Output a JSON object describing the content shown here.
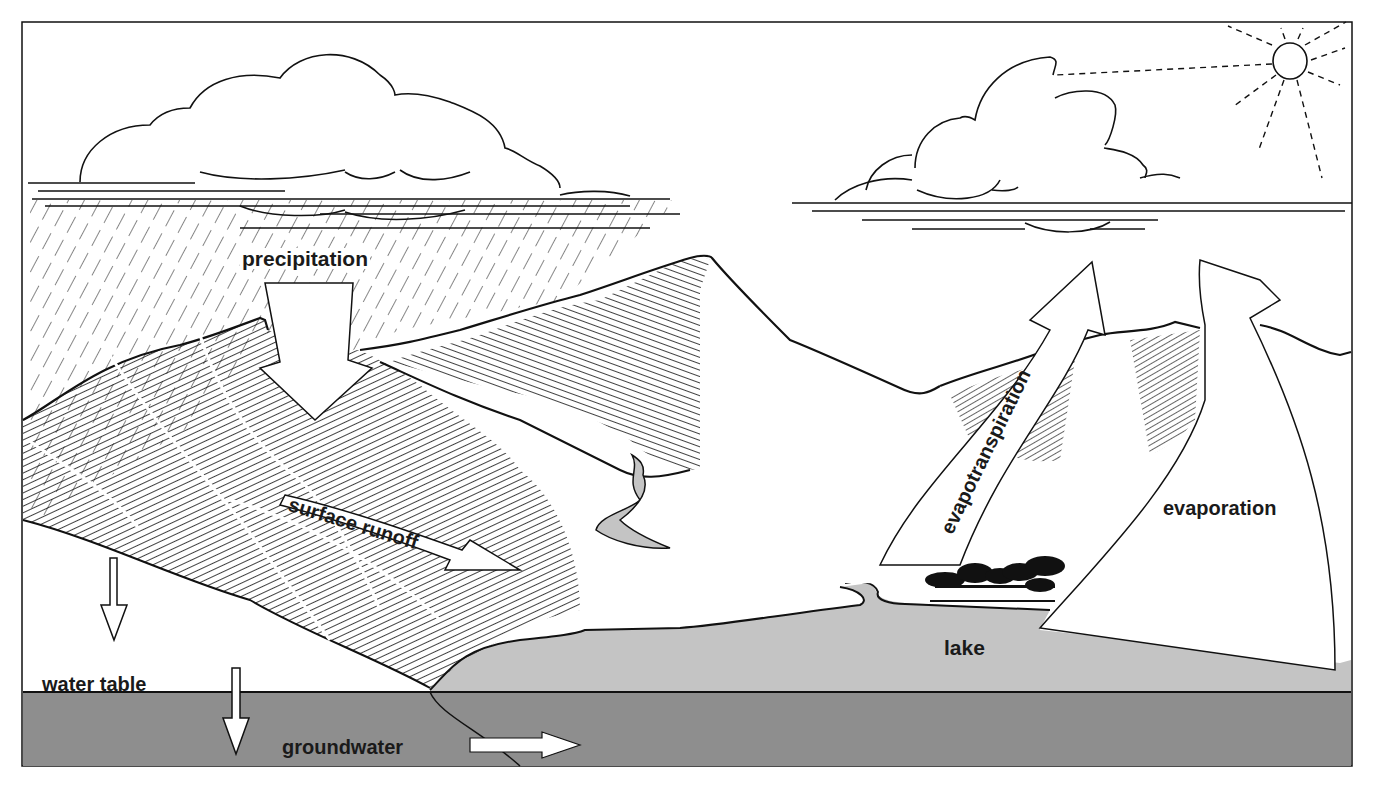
{
  "diagram": {
    "labels": {
      "precipitation": "precipitation",
      "surface_runoff": "surface runoff",
      "evapotranspiration": "evapotranspiration",
      "evaporation": "evaporation",
      "lake": "lake",
      "water_table": "water table",
      "groundwater": "groundwater"
    },
    "colors": {
      "background": "#ffffff",
      "line": "#111111",
      "lake": "#c4c4c4",
      "groundwater": "#8e8e8e",
      "river": "#c4c4c4"
    },
    "elements": [
      "cloud-left",
      "cloud-right",
      "sun",
      "rain",
      "mountains",
      "river",
      "lake",
      "trees",
      "groundwater-layer"
    ]
  }
}
